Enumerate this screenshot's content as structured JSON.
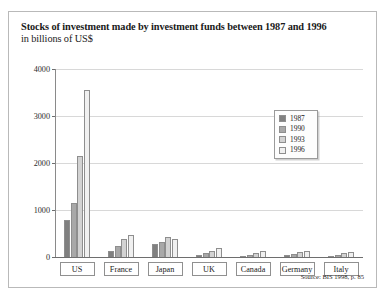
{
  "figure": {
    "title": "Stocks of investment made by investment funds between 1987 and 1996",
    "subtitle": "in billions of  US$",
    "source": "Source: BIS 1998, p. 85"
  },
  "legend": {
    "position": "inside-top-right",
    "items": [
      {
        "label": "1987",
        "color": "#808080"
      },
      {
        "label": "1990",
        "color": "#a8a8a8"
      },
      {
        "label": "1993",
        "color": "#d2d2d2"
      },
      {
        "label": "1996",
        "color": "#f0f0f0"
      }
    ]
  },
  "chart_data": {
    "type": "bar",
    "title": "Stocks of investment made by investment funds between 1987 and 1996",
    "subtitle": "in billions of  US$",
    "xlabel": "",
    "ylabel": "in billions of US$",
    "ylim": [
      0,
      4000
    ],
    "yticks": [
      0,
      1000,
      2000,
      3000,
      4000
    ],
    "ytick_labels": [
      "0",
      "1000",
      "2000",
      "3000",
      "4000"
    ],
    "grid": true,
    "categories": [
      "US",
      "France",
      "Japan",
      "UK",
      "Canada",
      "Germany",
      "Italy"
    ],
    "series": [
      {
        "name": "1987",
        "color": "#808080",
        "values": [
          780,
          130,
          280,
          50,
          15,
          35,
          30
        ]
      },
      {
        "name": "1990",
        "color": "#a8a8a8",
        "values": [
          1150,
          230,
          330,
          90,
          50,
          70,
          45
        ]
      },
      {
        "name": "1993",
        "color": "#d2d2d2",
        "values": [
          2150,
          390,
          420,
          130,
          90,
          100,
          75
        ]
      },
      {
        "name": "1996",
        "color": "#f0f0f0",
        "values": [
          3550,
          470,
          380,
          190,
          130,
          130,
          110
        ]
      }
    ]
  }
}
